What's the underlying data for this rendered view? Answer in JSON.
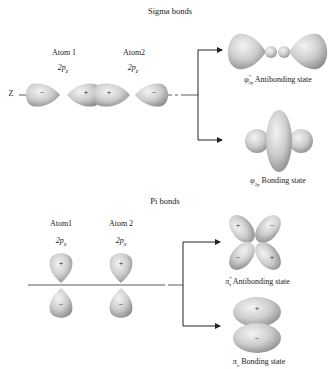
{
  "sigma": {
    "title": "Sigma bonds",
    "axis_label": "Z",
    "atom1": {
      "name": "Atom 1",
      "orbital": "2p",
      "orbital_sub": "z"
    },
    "atom2": {
      "name": "Atom2",
      "orbital": "2p",
      "orbital_sub": "z"
    },
    "lobe_signs": [
      "−",
      "+",
      "+",
      "−"
    ],
    "antibonding": {
      "symbol": "φ",
      "sup": "*",
      "sub": "2p",
      "text": "Antibonding state"
    },
    "bonding": {
      "symbol": "φ",
      "sub": "2p",
      "text": "Bonding state"
    }
  },
  "pi": {
    "title": "Pi bonds",
    "atom1": {
      "name": "Atom1",
      "orbital": "2p",
      "orbital_sub": "x"
    },
    "atom2": {
      "name": "Atom 2",
      "orbital": "2p",
      "orbital_sub": "x"
    },
    "lobe_signs_top": [
      "+",
      "+"
    ],
    "lobe_signs_bottom": [
      "−",
      "−"
    ],
    "antibonding": {
      "symbol": "π",
      "sup": "*",
      "sub": "x",
      "text": "Antibonding state",
      "signs": [
        "+",
        "−",
        "−",
        "+"
      ]
    },
    "bonding": {
      "symbol": "π",
      "sub": "x",
      "text": "Bonding state",
      "signs": [
        "+",
        "−"
      ]
    }
  },
  "colors": {
    "lobe_light": "#f2f2f2",
    "lobe_mid": "#c8c8c8",
    "lobe_dark": "#8a8a8a",
    "line": "#333333"
  }
}
